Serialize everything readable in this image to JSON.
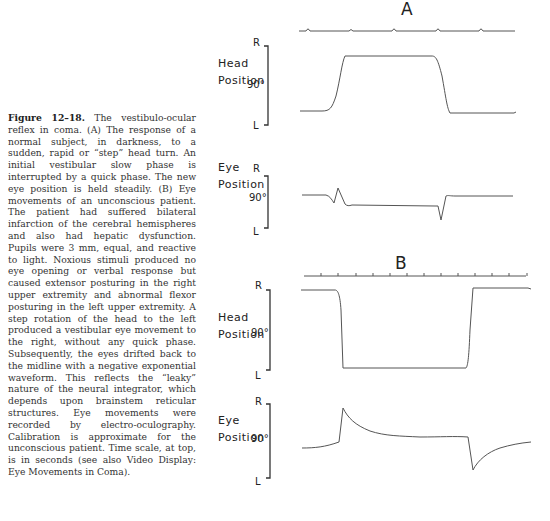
{
  "caption": {
    "figure_label": "Figure 12–18.",
    "text": "The vestibulo-ocular reflex in coma. (A) The response of a normal subject, in darkness, to a sudden, rapid or “step” head turn. An initial vestibular slow phase is interrupted by a quick phase. The new eye position is held steadily. (B) Eye movements of an unconscious patient. The patient had suffered bilateral infarction of the cerebral hemispheres and also had hepatic dysfunction. Pupils were 3 mm, equal, and reactive to light. Noxious stimuli produced no eye opening or verbal response but caused extensor posturing in the right upper extremity and abnormal flexor posturing in the left upper extremity. A step rotation of the head to the left produced a vestibular eye movement to the right, without any quick phase. Subsequently, the eyes drifted back to the midline with a negative exponential waveform. This reflects the “leaky” nature of the neural integrator, which depends upon brainstem reticular structures. Eye movements were recorded by electro-oculography. Calibration is approximate for the unconscious patient. Time scale, at top, is in seconds (see also Video Display: Eye Movements in Coma)."
  },
  "panels": {
    "A": {
      "letter": "A",
      "head": {
        "label_line1": "Head",
        "label_line2": "Position",
        "top": "R",
        "bottom": "L",
        "scale": "90°"
      },
      "eye": {
        "label_line1": "Eye",
        "label_line2": "Position",
        "top": "R",
        "bottom": "L",
        "scale": "90°"
      }
    },
    "B": {
      "letter": "B",
      "head": {
        "label_line1": "Head",
        "label_line2": "Position",
        "top": "R",
        "bottom": "L",
        "scale": "90°"
      },
      "eye": {
        "label_line1": "Eye",
        "label_line2": "Position",
        "top": "R",
        "bottom": "L",
        "scale": "90°"
      }
    }
  },
  "colors": {
    "trace": "#555555",
    "text": "#222222",
    "caption": "#333333"
  }
}
